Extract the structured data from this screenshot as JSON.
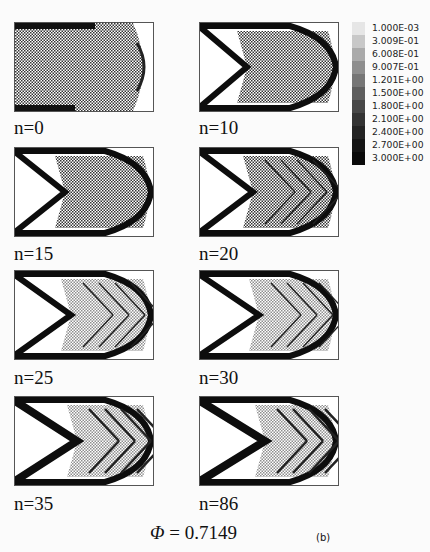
{
  "figure": {
    "panels": [
      {
        "label": "n=0",
        "stage": 0
      },
      {
        "label": "n=10",
        "stage": 1
      },
      {
        "label": "n=15",
        "stage": 2
      },
      {
        "label": "n=20",
        "stage": 3
      },
      {
        "label": "n=25",
        "stage": 4
      },
      {
        "label": "n=30",
        "stage": 5
      },
      {
        "label": "n=35",
        "stage": 6
      },
      {
        "label": "n=86",
        "stage": 7
      }
    ],
    "colorbar": {
      "ticks": [
        "1.000E-03",
        "3.009E-01",
        "6.008E-01",
        "9.007E-01",
        "1.201E+00",
        "1.500E+00",
        "1.800E+00",
        "2.100E+00",
        "2.400E+00",
        "2.700E+00",
        "3.000E+00"
      ],
      "colors": [
        "#e6e6e6",
        "#c8c8c8",
        "#aaaaaa",
        "#8e8e8e",
        "#767676",
        "#5e5e5e",
        "#474747",
        "#333333",
        "#232323",
        "#151515",
        "#0a0a0a"
      ]
    },
    "phi_symbol": "Φ",
    "phi_value": "= 0.7149",
    "sublabel": "(b)"
  }
}
